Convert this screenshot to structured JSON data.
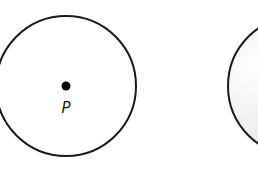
{
  "figure": {
    "left_circle": {
      "cx": 66,
      "cy": 86,
      "r": 70,
      "stroke": "#1a1a1a",
      "fill": "#ffffff",
      "center_point": {
        "label": "P",
        "cx": 66,
        "cy": 86,
        "r": 4
      }
    },
    "right_circle": {
      "cx": 298,
      "cy": 86,
      "r": 70,
      "stroke": "#1a1a1a",
      "gradient": {
        "light": "#ffffff",
        "dark": "#c8c8c8"
      }
    }
  }
}
